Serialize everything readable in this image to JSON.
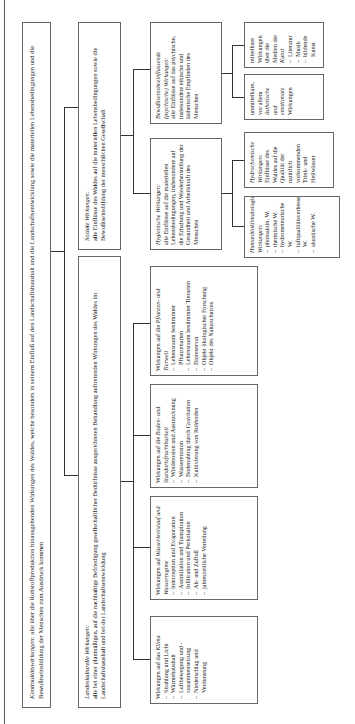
{
  "diagram": {
    "root": {
      "title": "Kontinuitätswirkungen:",
      "text": "alle über die Rohstoffproduktion hinausgehenden Wirkungen des Waldes, welche besonders in seinem Einfluß auf den Landschaftshaushalt und die Landschaftsentwicklung sowie die materiellen Lebensbedingungen und die Bewußtseinsbildung der Menschen zum Ausdruck kommen"
    },
    "landeskulturelle": {
      "title": "Landeskulturelle Wirkungen:",
      "text": "alle bei einer planmäßigen, auf die nachhaltige Befriedigung gesellschaftlicher Bedürfnisse ausgerichteten Behandlung auftretenden Wirkungen des Waldes im Landschaftshaushalt und bei der Landschaftsentwicklung",
      "children": [
        {
          "intro": "Wirkungen auf das",
          "title": "Klima",
          "items": [
            "Strahlung und Licht",
            "Wärmehaushalt",
            "Luftbewegung und -zusammensetzung",
            "Niederschlag und Verdunstung"
          ]
        },
        {
          "intro": "Wirkungen auf",
          "title": "Wasserkreislauf und Wasserregime",
          "items": [
            "Interzeption und Evaporation",
            "Assimilation und Transpiration",
            "Infiltration und Perkolation",
            "Ab- und Zufluß",
            "jahreszeitliche Verteilung"
          ]
        },
        {
          "intro": "Wirkungen auf die",
          "title": "Boden- und Standortsfruchtbarkeit",
          "items": [
            "Winderosion und Austrocknung",
            "Wassererosion",
            "Bodenabtrag durch Gravitation",
            "Kultivierung von Rohboden"
          ]
        },
        {
          "intro": "Wirkungen auf die",
          "title": "Pflanzen- und Tierwelt",
          "items": [
            "Lebensraum bestimmter Pflanzenarten",
            "Lebensraum bestimmter Tierarten",
            "Bioreservat",
            "Objekt ökologischer Forschung",
            "Objekt des Naturschutzes"
          ]
        }
      ]
    },
    "soziale": {
      "title": "Soziale Wirkungen:",
      "text": "alle Einflüsse des Waldes auf die materiellen Lebensbedingungen sowie die Bewußtseinsbildung der menschlichen Gesellschaft",
      "hygienische": {
        "title": "Hygienische Wirkungen:",
        "text": "alle Einflüsse auf die materiellen Lebensbedingungen, insbesondere auf die Erhaltung und Wiederherstellung der Gesundheit und Arbeitskraft des Menschen",
        "children": [
          {
            "title": "Humanbioklimatologische Wirkungen:",
            "items": [
              "photoaktin. W.",
              "thermische W.",
              "hydrometeorische W.",
              "luftqualitätsverbessernde W.",
              "akustische W."
            ]
          },
          {
            "title": "Hydrochemische Wirkungen:",
            "text": "Einflüsse des Waldes auf die Qualität der natürlich vorkommenden Trink- und Heilwässer"
          }
        ]
      },
      "bewusstsein": {
        "title": "Bewußtseinsbeeinflussende (psychische) Wirkungen:",
        "text": "alle Einflüsse auf das psychische, insbesondere ethische und ästhetische Empfinden des Menschen",
        "children": [
          {
            "pre": "unmittelbare, vor allem",
            "title": "ästhetische und emotionale",
            "post": "Wirkungen"
          },
          {
            "pre": "mittelbare Wirkungen über die Medien der",
            "title": "Kunst",
            "items": [
              "Literatur",
              "Musik",
              "bildende Kunst"
            ]
          }
        ]
      }
    }
  }
}
